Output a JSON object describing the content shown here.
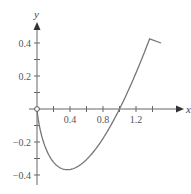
{
  "chart_data": {
    "type": "line",
    "title": "",
    "xlabel": "x",
    "ylabel": "y",
    "function": "y = x ln x",
    "x_ticks": [
      0.4,
      0.8,
      1.2
    ],
    "y_ticks": [
      0.4,
      0.2,
      -0.2,
      -0.4
    ],
    "x_tick_labels": [
      "0.4",
      "0.8",
      "1.2"
    ],
    "y_tick_labels": [
      "0.4",
      "0.2",
      "−0.2",
      "−0.4"
    ],
    "xlim": [
      0,
      1.55
    ],
    "ylim": [
      -0.42,
      0.45
    ],
    "grid": false,
    "open_point": [
      0,
      0
    ],
    "series": [
      {
        "name": "y = x ln x",
        "x": [
          0.01,
          0.05,
          0.1,
          0.15,
          0.2,
          0.25,
          0.3,
          0.368,
          0.45,
          0.5,
          0.6,
          0.7,
          0.8,
          0.9,
          1.0,
          1.1,
          1.2,
          1.3,
          1.37,
          1.5
        ],
        "y": [
          -0.046,
          -0.15,
          -0.23,
          -0.285,
          -0.322,
          -0.347,
          -0.361,
          -0.368,
          -0.359,
          -0.347,
          -0.306,
          -0.25,
          -0.179,
          -0.095,
          0.0,
          0.105,
          0.219,
          0.341,
          0.431,
          0.608
        ]
      }
    ],
    "color": "#777777"
  }
}
